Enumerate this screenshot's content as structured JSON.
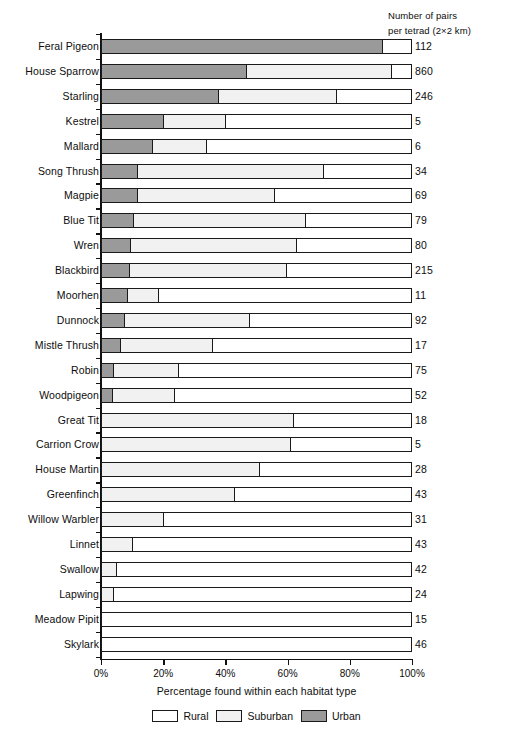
{
  "header": {
    "line1": "Number of pairs",
    "line2": "per tetrad (2×2 km)"
  },
  "axis": {
    "x_title": "Percentage found within each habitat type",
    "x_ticks": [
      "0%",
      "20%",
      "40%",
      "60%",
      "80%",
      "100%"
    ]
  },
  "legend": {
    "items": [
      {
        "label": "Rural",
        "swatch": "rural-swatch",
        "color": "#ffffff"
      },
      {
        "label": "Suburban",
        "swatch": "suburban-swatch",
        "color": "#f1f1f1"
      },
      {
        "label": "Urban",
        "swatch": "urban-swatch",
        "color": "#9a9a9a"
      }
    ]
  },
  "chart_data": {
    "type": "bar",
    "orientation": "horizontal",
    "stacked": true,
    "title": "",
    "xlabel": "Percentage found within each habitat type",
    "ylabel": "",
    "xlim": [
      0,
      100
    ],
    "xticks": [
      0,
      20,
      40,
      60,
      80,
      100
    ],
    "grid": false,
    "legend_position": "bottom",
    "value_column_header": "Number of pairs per tetrad (2×2 km)",
    "categories": [
      "Feral Pigeon",
      "House Sparrow",
      "Starling",
      "Kestrel",
      "Mallard",
      "Song Thrush",
      "Magpie",
      "Blue Tit",
      "Wren",
      "Blackbird",
      "Moorhen",
      "Dunnock",
      "Mistle Thrush",
      "Robin",
      "Woodpigeon",
      "Great Tit",
      "Carrion Crow",
      "House Martin",
      "Greenfinch",
      "Willow Warbler",
      "Linnet",
      "Swallow",
      "Lapwing",
      "Meadow Pipit",
      "Skylark"
    ],
    "series": [
      {
        "name": "Urban",
        "color": "#9a9a9a",
        "values": [
          91,
          47,
          38,
          20,
          16.5,
          11.5,
          11.5,
          10.5,
          9.5,
          9,
          8.5,
          7.5,
          6,
          4,
          3.5,
          0,
          0,
          0,
          0,
          0,
          0,
          0,
          0,
          0,
          0
        ]
      },
      {
        "name": "Suburban",
        "color": "#f1f1f1",
        "values": [
          0,
          47,
          38,
          20,
          17.5,
          60.5,
          44.5,
          55.5,
          53.5,
          51,
          10,
          40.5,
          30,
          21,
          20,
          62,
          61,
          51,
          43,
          20,
          10,
          5,
          4,
          0,
          0
        ]
      },
      {
        "name": "Rural",
        "color": "#ffffff",
        "values": [
          9,
          6,
          24,
          60,
          66,
          28,
          44,
          34,
          37,
          40,
          81.5,
          52,
          64,
          75,
          76.5,
          38,
          39,
          49,
          57,
          80,
          90,
          95,
          96,
          100,
          100
        ]
      }
    ],
    "pairs_per_tetrad": [
      112,
      860,
      246,
      5,
      6,
      34,
      69,
      79,
      80,
      215,
      11,
      92,
      17,
      75,
      52,
      18,
      5,
      28,
      43,
      31,
      43,
      42,
      24,
      15,
      46
    ]
  }
}
